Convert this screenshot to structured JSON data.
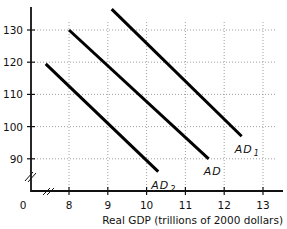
{
  "chart_data": {
    "type": "line",
    "title": "",
    "xlabel": "Real GDP (trillions of 2000 dollars)",
    "ylabel": "",
    "origin_label": "0",
    "xlim": [
      7,
      13.5
    ],
    "ylim": [
      80,
      140
    ],
    "x_ticks": [
      8,
      9,
      10,
      11,
      12,
      13
    ],
    "x_tick_labels": [
      "8",
      "9",
      "10",
      "11",
      "12",
      "13"
    ],
    "y_ticks": [
      90,
      100,
      110,
      120,
      130
    ],
    "y_tick_labels": [
      "90",
      "100",
      "110",
      "120",
      "130"
    ],
    "grid": true,
    "axis_breaks": [
      "x",
      "y"
    ],
    "series": [
      {
        "name": "AD2",
        "label": "AD",
        "subscript": "2",
        "x": [
          7.4,
          10.3
        ],
        "y": [
          119.5,
          86
        ]
      },
      {
        "name": "AD",
        "label": "AD",
        "subscript": "",
        "x": [
          8.0,
          11.6
        ],
        "y": [
          130,
          90
        ]
      },
      {
        "name": "AD1",
        "label": "AD",
        "subscript": "1",
        "x": [
          9.1,
          12.45
        ],
        "y": [
          136.5,
          97
        ]
      }
    ]
  }
}
